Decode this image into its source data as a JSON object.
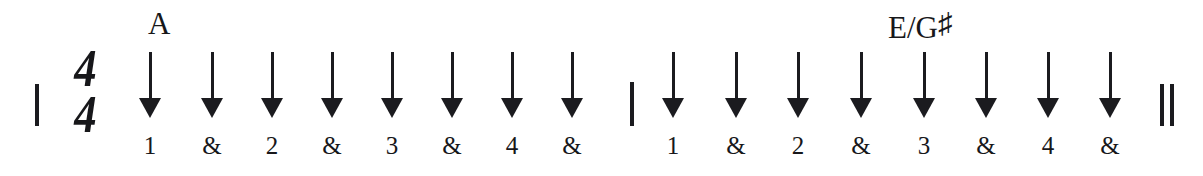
{
  "diagram": {
    "time_signature": {
      "numerator": "4",
      "denominator": "4"
    },
    "ink_color": "#1b1b1f",
    "background_color": "#ffffff",
    "barlines": [
      {
        "name": "start-barline",
        "type": "single"
      },
      {
        "name": "middle-barline",
        "type": "single"
      },
      {
        "name": "end-barline",
        "type": "double"
      }
    ],
    "chords": [
      {
        "label": "A",
        "sharp": "",
        "x": 148
      },
      {
        "label": "E/G",
        "sharp": "♯",
        "x": 888
      }
    ],
    "measures": [
      {
        "index": 1,
        "beats": [
          {
            "count": "1",
            "direction": "down",
            "x": 150
          },
          {
            "count": "&",
            "direction": "down",
            "x": 212
          },
          {
            "count": "2",
            "direction": "down",
            "x": 272
          },
          {
            "count": "&",
            "direction": "down",
            "x": 332
          },
          {
            "count": "3",
            "direction": "down",
            "x": 392
          },
          {
            "count": "&",
            "direction": "down",
            "x": 452
          },
          {
            "count": "4",
            "direction": "down",
            "x": 512
          },
          {
            "count": "&",
            "direction": "down",
            "x": 572
          }
        ]
      },
      {
        "index": 2,
        "beats": [
          {
            "count": "1",
            "direction": "down",
            "x": 673
          },
          {
            "count": "&",
            "direction": "down",
            "x": 736
          },
          {
            "count": "2",
            "direction": "down",
            "x": 798
          },
          {
            "count": "&",
            "direction": "down",
            "x": 861
          },
          {
            "count": "3",
            "direction": "down",
            "x": 924
          },
          {
            "count": "&",
            "direction": "down",
            "x": 986
          },
          {
            "count": "4",
            "direction": "down",
            "x": 1048
          },
          {
            "count": "&",
            "direction": "down",
            "x": 1110
          }
        ]
      }
    ]
  }
}
